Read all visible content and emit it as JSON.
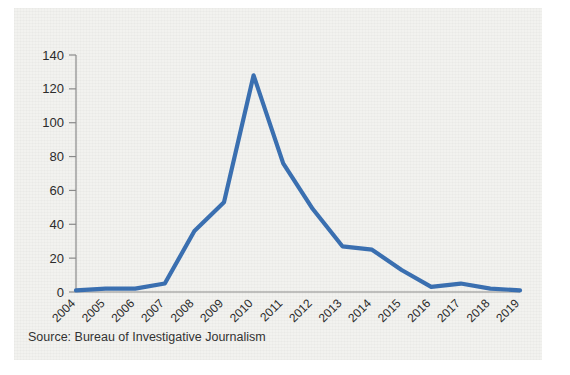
{
  "figure": {
    "source_note": "Source: Bureau of Investigative Journalism",
    "background_color": "#f2f2ef",
    "line_color": "#3a6fb0",
    "axis_color": "#8a8a8a",
    "text_color": "#2b2b2b"
  },
  "chart_data": {
    "type": "line",
    "title": "",
    "subtitle": "",
    "xlabel": "",
    "ylabel": "",
    "categories": [
      "2004",
      "2005",
      "2006",
      "2007",
      "2008",
      "2009",
      "2010",
      "2011",
      "2012",
      "2013",
      "2014",
      "2015",
      "2016",
      "2017",
      "2018",
      "2019"
    ],
    "values": [
      1,
      2,
      2,
      5,
      36,
      53,
      128,
      76,
      49,
      27,
      25,
      13,
      3,
      5,
      2,
      1
    ],
    "series": [
      {
        "name": "Strikes",
        "values": [
          1,
          2,
          2,
          5,
          36,
          53,
          128,
          76,
          49,
          27,
          25,
          13,
          3,
          5,
          2,
          1
        ]
      }
    ],
    "ylim": [
      0,
      140
    ],
    "yticks": [
      0,
      20,
      40,
      60,
      80,
      100,
      120,
      140
    ],
    "ytick_labels": [
      "0",
      "20",
      "40",
      "60",
      "80",
      "100",
      "120",
      "140"
    ],
    "grid": false,
    "legend": false,
    "legend_position": "none",
    "xtick_rotation": -45
  }
}
